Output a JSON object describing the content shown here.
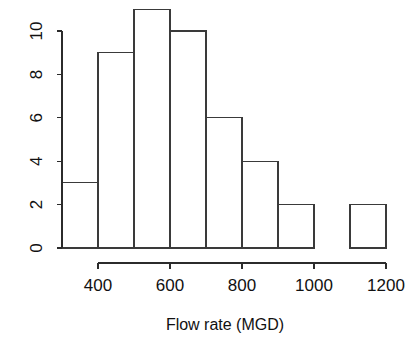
{
  "chart_data": {
    "type": "bar",
    "title": "",
    "subtitle": "",
    "xlabel": "Flow rate (MGD)",
    "ylabel": "",
    "bin_width": 100,
    "bin_edges": [
      300,
      400,
      500,
      600,
      700,
      800,
      900,
      1000,
      1100,
      1200
    ],
    "categories": [
      "300-400",
      "400-500",
      "500-600",
      "600-700",
      "700-800",
      "800-900",
      "900-1000",
      "1000-1100",
      "1100-1200"
    ],
    "values": [
      3,
      9,
      11,
      10,
      6,
      4,
      2,
      0,
      2
    ],
    "xlim": [
      300,
      1200
    ],
    "ylim": [
      0,
      11
    ],
    "x_ticks": [
      400,
      600,
      800,
      1000,
      1200
    ],
    "x_tick_labels": [
      "400",
      "600",
      "800",
      "1000",
      "1200"
    ],
    "y_ticks": [
      0,
      2,
      4,
      6,
      8,
      10
    ],
    "y_tick_labels": [
      "0",
      "2",
      "4",
      "6",
      "8",
      "10"
    ],
    "grid": false,
    "legend": false,
    "legend_position": "none",
    "bar_fill": "#ffffff",
    "bar_stroke": "#3a3a3a",
    "axis_color": "#2b2b2b",
    "background": "#ffffff"
  },
  "axes": {
    "y_axis_name": "count-axis",
    "x_axis_name": "flow-rate-axis"
  },
  "labels": {
    "y0": "0",
    "y2": "2",
    "y4": "4",
    "y6": "6",
    "y8": "8",
    "y10": "10",
    "x400": "400",
    "x600": "600",
    "x800": "800",
    "x1000": "1000",
    "x1200": "1200",
    "x_axis_title": "Flow rate (MGD)"
  }
}
